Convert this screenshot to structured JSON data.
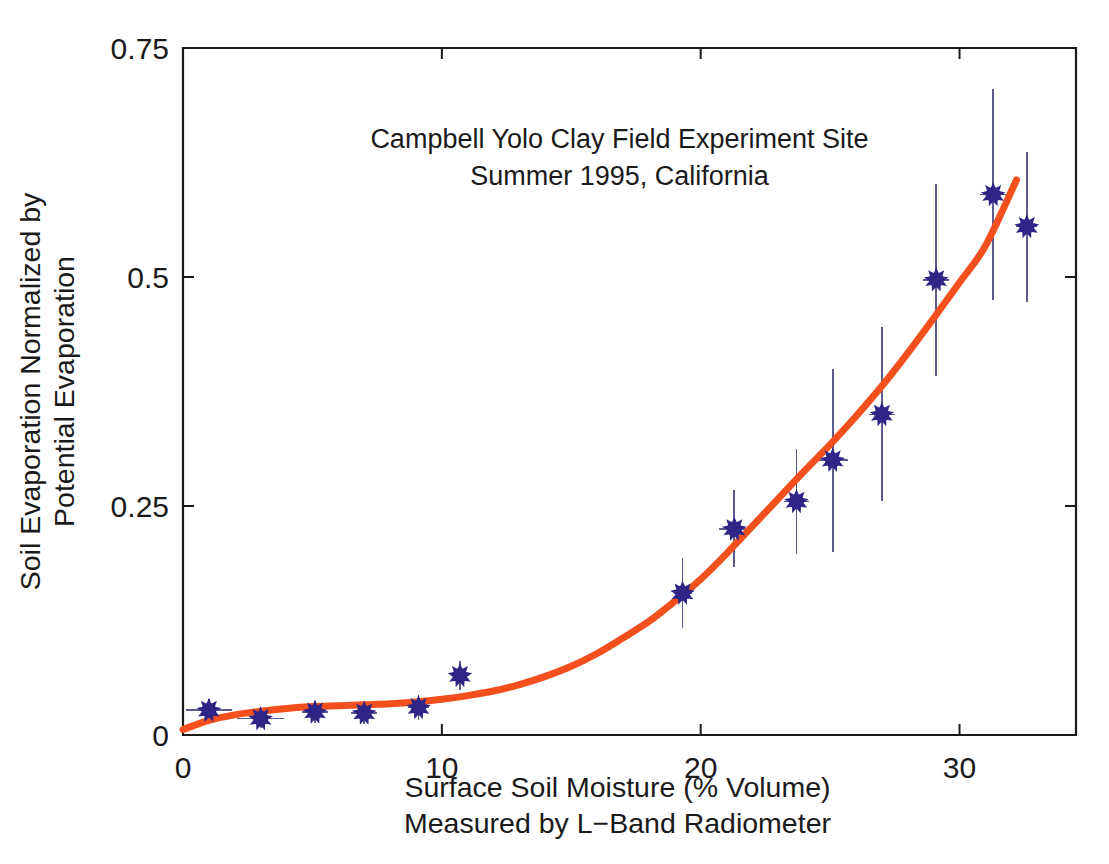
{
  "chart_data": {
    "type": "scatter",
    "title": "Campbell Yolo Clay Field Experiment Site",
    "subtitle": "Summer 1995, California",
    "title_lines": [
      "Campbell Yolo Clay Field Experiment Site",
      "Summer 1995, California"
    ],
    "xlabel": "Surface Soil Moisture (% Volume)",
    "xlabel_line2": "Measured by L−Band Radiometer",
    "ylabel": "Soil Evaporation Normalized by",
    "ylabel_line2": "Potential Evaporation",
    "xlim": [
      0,
      34.5
    ],
    "ylim": [
      0,
      0.75
    ],
    "xticks": [
      0,
      10,
      20,
      30
    ],
    "xticklabels": [
      "0",
      "10",
      "20",
      "30"
    ],
    "yticks": [
      0,
      0.25,
      0.5,
      0.75
    ],
    "yticklabels": [
      "0",
      "0.25",
      "0.5",
      "0.75"
    ],
    "grid": false,
    "legend": "none",
    "marker_color": "#2e2586",
    "errorbar_color": "#5b5a8c",
    "curve_color": "#f4501e",
    "axis_color": "#1a1a1a",
    "background": "#ffffff",
    "series": [
      {
        "name": "Measured normalized soil evaporation",
        "marker": "star-dot",
        "points": [
          {
            "x": 1.0,
            "y": 0.027,
            "xerr": 0.9,
            "yerr": 0.012
          },
          {
            "x": 3.0,
            "y": 0.018,
            "xerr": 0.9,
            "yerr": 0.01
          },
          {
            "x": 5.1,
            "y": 0.025,
            "xerr": 0.5,
            "yerr": 0.012
          },
          {
            "x": 7.0,
            "y": 0.024,
            "xerr": 0.5,
            "yerr": 0.012
          },
          {
            "x": 9.1,
            "y": 0.03,
            "xerr": 0.4,
            "yerr": 0.014
          },
          {
            "x": 10.7,
            "y": 0.065,
            "xerr": 0.35,
            "yerr": 0.016
          },
          {
            "x": 19.3,
            "y": 0.155,
            "xerr": 0.35,
            "yerr": 0.038
          },
          {
            "x": 21.3,
            "y": 0.225,
            "xerr": 0.6,
            "yerr": 0.042
          },
          {
            "x": 23.7,
            "y": 0.255,
            "xerr": 0.5,
            "yerr": 0.057
          },
          {
            "x": 25.1,
            "y": 0.3,
            "xerr": 0.6,
            "yerr": 0.1
          },
          {
            "x": 27.0,
            "y": 0.35,
            "xerr": 0.5,
            "yerr": 0.095
          },
          {
            "x": 29.1,
            "y": 0.497,
            "xerr": 0.5,
            "yerr": 0.105
          },
          {
            "x": 31.3,
            "y": 0.59,
            "xerr": 0.5,
            "yerr": 0.115
          },
          {
            "x": 32.6,
            "y": 0.555,
            "xerr": 0.4,
            "yerr": 0.082
          }
        ]
      }
    ],
    "fit_curve": {
      "name": "Fitted evaporation efficiency curve",
      "color": "#f4501e",
      "width": 7,
      "points": [
        {
          "x": 0.0,
          "y": 0.006
        },
        {
          "x": 1.0,
          "y": 0.016
        },
        {
          "x": 2.0,
          "y": 0.022
        },
        {
          "x": 3.0,
          "y": 0.026
        },
        {
          "x": 4.0,
          "y": 0.029
        },
        {
          "x": 5.0,
          "y": 0.031
        },
        {
          "x": 6.0,
          "y": 0.032
        },
        {
          "x": 7.0,
          "y": 0.033
        },
        {
          "x": 8.0,
          "y": 0.034
        },
        {
          "x": 9.0,
          "y": 0.036
        },
        {
          "x": 10.0,
          "y": 0.039
        },
        {
          "x": 11.0,
          "y": 0.043
        },
        {
          "x": 12.0,
          "y": 0.048
        },
        {
          "x": 13.0,
          "y": 0.055
        },
        {
          "x": 14.0,
          "y": 0.064
        },
        {
          "x": 15.0,
          "y": 0.075
        },
        {
          "x": 16.0,
          "y": 0.089
        },
        {
          "x": 17.0,
          "y": 0.106
        },
        {
          "x": 18.0,
          "y": 0.124
        },
        {
          "x": 19.0,
          "y": 0.146
        },
        {
          "x": 20.0,
          "y": 0.17
        },
        {
          "x": 21.0,
          "y": 0.198
        },
        {
          "x": 22.0,
          "y": 0.228
        },
        {
          "x": 23.0,
          "y": 0.258
        },
        {
          "x": 24.0,
          "y": 0.288
        },
        {
          "x": 25.0,
          "y": 0.317
        },
        {
          "x": 26.0,
          "y": 0.348
        },
        {
          "x": 27.0,
          "y": 0.381
        },
        {
          "x": 28.0,
          "y": 0.417
        },
        {
          "x": 29.0,
          "y": 0.455
        },
        {
          "x": 30.0,
          "y": 0.494
        },
        {
          "x": 31.0,
          "y": 0.534
        },
        {
          "x": 32.2,
          "y": 0.606
        }
      ]
    }
  }
}
